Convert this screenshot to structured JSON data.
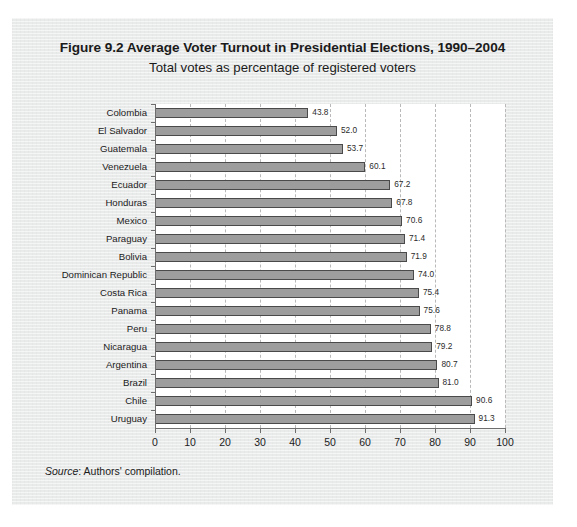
{
  "figure": {
    "title": "Figure 9.2 Average Voter Turnout in Presidential Elections, 1990–2004",
    "subtitle": "Total votes as percentage of registered voters",
    "source_label": "Source",
    "source_text": ": Authors' compilation."
  },
  "chart_data": {
    "type": "bar",
    "orientation": "horizontal",
    "title": "Figure 9.2 Average Voter Turnout in Presidential Elections, 1990–2004",
    "subtitle": "Total votes as percentage of registered voters",
    "xlabel": "",
    "ylabel": "",
    "xlim": [
      0,
      100
    ],
    "xticks": [
      0,
      10,
      20,
      30,
      40,
      50,
      60,
      70,
      80,
      90,
      100
    ],
    "grid": "vertical-dashed",
    "legend": "none",
    "bar_fill": "#9d9d9d",
    "bar_edge": "#4a4a4a",
    "categories": [
      "Colombia",
      "El Salvador",
      "Guatemala",
      "Venezuela",
      "Ecuador",
      "Honduras",
      "Mexico",
      "Paraguay",
      "Bolivia",
      "Dominican Republic",
      "Costa Rica",
      "Panama",
      "Peru",
      "Nicaragua",
      "Argentina",
      "Brazil",
      "Chile",
      "Uruguay"
    ],
    "values": [
      43.8,
      52.0,
      53.7,
      60.1,
      67.2,
      67.8,
      70.6,
      71.4,
      71.9,
      74.0,
      75.4,
      75.6,
      78.8,
      79.2,
      80.7,
      81.0,
      90.6,
      91.3
    ],
    "value_labels": [
      "43.8",
      "52.0",
      "53.7",
      "60.1",
      "67.2",
      "67.8",
      "70.6",
      "71.4",
      "71.9",
      "74.0",
      "75.4",
      "75.6",
      "78.8",
      "79.2",
      "80.7",
      "81.0",
      "90.6",
      "91.3"
    ]
  }
}
